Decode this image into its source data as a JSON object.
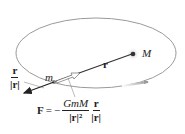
{
  "diagram": {
    "labels": {
      "large_mass": "M",
      "small_mass": "m",
      "position_vector": "r",
      "unit_vector_num": "r",
      "unit_vector_den": "|r|"
    },
    "formula": {
      "lhs": "F",
      "equals": "=",
      "minus": "−",
      "coef_num": "GmM",
      "coef_den": "|r|²",
      "vec_num": "r",
      "vec_den": "|r|"
    },
    "colors": {
      "orbit": "#9a9a9a",
      "vector": "#222222",
      "text": "#222222",
      "glow": "#d0d0d0"
    }
  }
}
